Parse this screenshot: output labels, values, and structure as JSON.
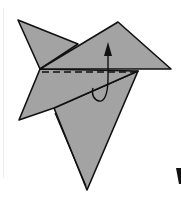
{
  "diagram": {
    "type": "origami-fold-step",
    "colors": {
      "paper": "#a3a3a3",
      "line": "#111111",
      "background": "#ffffff"
    },
    "symbols": {
      "fold_line": "dashed-valley-fold-line",
      "arrow": "fold-up-arrow"
    },
    "partial_glyph": "V"
  }
}
